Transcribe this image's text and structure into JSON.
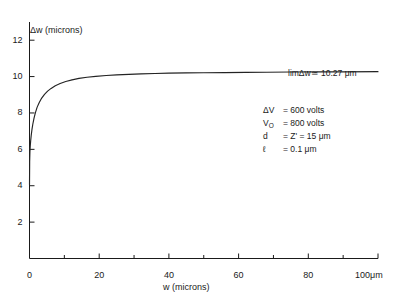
{
  "chart_data": {
    "type": "line",
    "title": "",
    "xlabel": "w (microns)",
    "ylabel": "Δw (microns)",
    "xlim": [
      0,
      100
    ],
    "ylim": [
      0,
      13
    ],
    "grid": false,
    "legend": "none",
    "x_unit_label": "100μm",
    "x_ticks_major": [
      0,
      20,
      40,
      60,
      80,
      100
    ],
    "x_tick_labels": [
      "0",
      "20",
      "40",
      "60",
      "80",
      "100"
    ],
    "x_ticks_minor": [
      10,
      30,
      50,
      70,
      90
    ],
    "y_ticks_major": [
      2,
      4,
      6,
      8,
      10,
      12
    ],
    "y_tick_labels": [
      "2",
      "4",
      "6",
      "8",
      "10",
      "12"
    ],
    "asymptote": 10.27,
    "series": [
      {
        "name": "Δw(w)",
        "x": [
          0.0,
          0.05,
          0.12,
          0.22,
          0.35,
          0.5,
          0.7,
          0.95,
          1.3,
          1.7,
          2.2,
          2.8,
          3.5,
          4.3,
          5.2,
          6.2,
          7.4,
          8.8,
          10.4,
          12.2,
          14.2,
          16.5,
          19.0,
          22.0,
          25.0,
          28.5,
          32.0,
          36.0,
          40.0,
          45.0,
          50.0,
          56.0,
          62.0,
          68.0,
          75.0,
          82.0,
          90.0,
          100.0
        ],
        "y": [
          4.05,
          5.35,
          5.85,
          6.2,
          6.5,
          6.78,
          7.08,
          7.38,
          7.72,
          8.02,
          8.32,
          8.58,
          8.82,
          9.02,
          9.2,
          9.35,
          9.5,
          9.62,
          9.73,
          9.82,
          9.9,
          9.96,
          10.01,
          10.06,
          10.09,
          10.12,
          10.15,
          10.17,
          10.19,
          10.2,
          10.21,
          10.22,
          10.23,
          10.24,
          10.25,
          10.255,
          10.26,
          10.27
        ]
      }
    ],
    "annotations": {
      "limit_text": "limΔw≃ 10.27 μm",
      "parameters": [
        {
          "symbol": "ΔV",
          "value": "= 600 volts"
        },
        {
          "symbol": "V0",
          "symbol_base": "V",
          "symbol_sub": "O",
          "value": "= 800 volts"
        },
        {
          "symbol": "d",
          "value": "=  Z' = 15 μm"
        },
        {
          "symbol": "ℓ",
          "value": "= 0.1 μm"
        }
      ]
    }
  }
}
